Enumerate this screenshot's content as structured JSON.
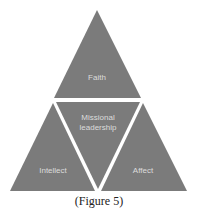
{
  "diagram": {
    "type": "triangle-of-triangles",
    "colors": {
      "fill": "#7b7b7b",
      "text": "#dcdcdc",
      "divider": "#ffffff",
      "background": "#ffffff"
    },
    "segments": {
      "top": {
        "label": "Faith"
      },
      "center": {
        "label_line1": "Missional",
        "label_line2": "leadership"
      },
      "bottom_left": {
        "label": "Intellect"
      },
      "bottom_right": {
        "label": "Affect"
      }
    }
  },
  "caption": "(Figure 5)"
}
